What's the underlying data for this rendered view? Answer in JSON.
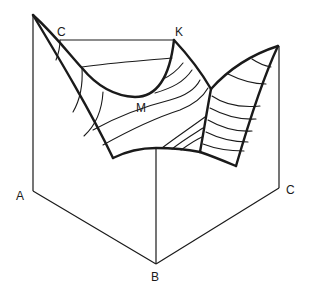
{
  "diagram": {
    "type": "ternary liquidus surface (3D perspective)",
    "labels": {
      "vertex_A": "A",
      "vertex_B": "B",
      "vertex_C_right": "C",
      "point_C_top": "C",
      "point_K": "K",
      "point_M": "M"
    },
    "colors": {
      "line": "#1a1a1a",
      "background": "#ffffff"
    }
  }
}
